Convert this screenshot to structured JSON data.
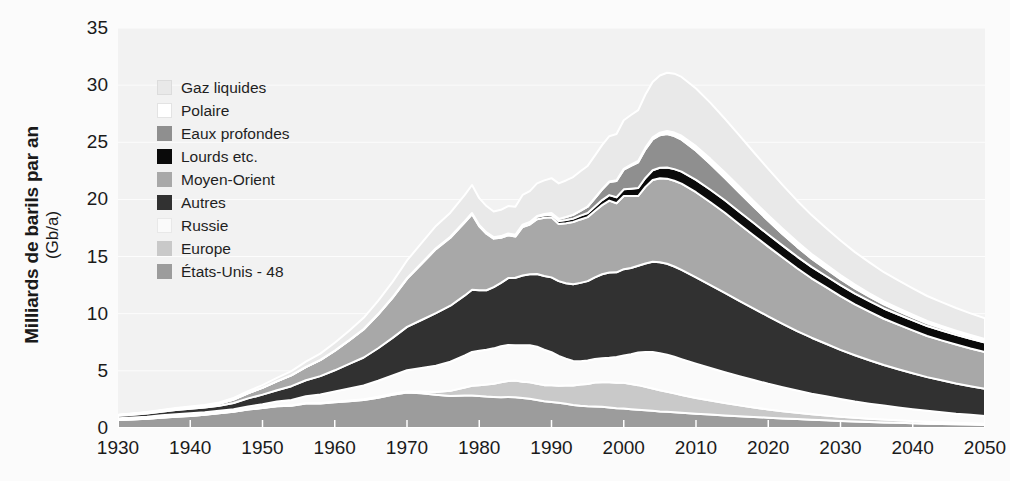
{
  "axes": {
    "y_title_line1": "Milliards de barils par an",
    "y_title_line2": "(Gb/a)",
    "y_ticks": [
      "35",
      "30",
      "25",
      "20",
      "15",
      "10",
      "5",
      "0"
    ],
    "x_ticks": [
      "1930",
      "1940",
      "1950",
      "1960",
      "1970",
      "1980",
      "1990",
      "2000",
      "2010",
      "2020",
      "2030",
      "2040",
      "2050"
    ]
  },
  "legend": {
    "items": [
      {
        "label": "Gaz liquides",
        "color": "#e9e9e9",
        "border": "#dcdcdc"
      },
      {
        "label": "Polaire",
        "color": "#ffffff",
        "border": "#e3e3e3"
      },
      {
        "label": "Eaux profondes",
        "color": "#8f8f8f",
        "border": "#8f8f8f"
      },
      {
        "label": "Lourds etc.",
        "color": "#0a0a0a",
        "border": "#0a0a0a"
      },
      {
        "label": "Moyen-Orient",
        "color": "#a8a8a8",
        "border": "#a8a8a8"
      },
      {
        "label": "Autres",
        "color": "#313131",
        "border": "#313131"
      },
      {
        "label": "Russie",
        "color": "#fafafa",
        "border": "#e8e8e8"
      },
      {
        "label": "Europe",
        "color": "#c9c9c9",
        "border": "#c9c9c9"
      },
      {
        "label": "États-Unis - 48",
        "color": "#9c9c9c",
        "border": "#9c9c9c"
      }
    ]
  },
  "chart_data": {
    "type": "area",
    "stacked": true,
    "title": "",
    "xlabel": "",
    "ylabel": "Milliards de barils par an (Gb/a)",
    "xlim": [
      1930,
      2050
    ],
    "ylim": [
      0,
      35
    ],
    "grid": true,
    "legend_position": "inside-top-left",
    "plot_background": "#f2f2f2",
    "separator_color": "#ffffff",
    "x": [
      1930,
      1932,
      1934,
      1936,
      1938,
      1940,
      1942,
      1944,
      1946,
      1948,
      1950,
      1952,
      1954,
      1956,
      1958,
      1960,
      1962,
      1964,
      1966,
      1968,
      1970,
      1972,
      1974,
      1976,
      1978,
      1979,
      1980,
      1981,
      1982,
      1983,
      1984,
      1985,
      1986,
      1987,
      1988,
      1989,
      1990,
      1991,
      1992,
      1993,
      1994,
      1995,
      1996,
      1997,
      1998,
      1999,
      2000,
      2001,
      2002,
      2003,
      2004,
      2005,
      2006,
      2007,
      2008,
      2010,
      2012,
      2014,
      2016,
      2018,
      2020,
      2022,
      2024,
      2026,
      2028,
      2030,
      2032,
      2034,
      2036,
      2038,
      2040,
      2042,
      2044,
      2046,
      2048,
      2050
    ],
    "series": [
      {
        "name": "États-Unis - 48",
        "color": "#9c9c9c",
        "values": [
          0.7,
          0.75,
          0.8,
          0.9,
          0.98,
          1.05,
          1.15,
          1.3,
          1.42,
          1.62,
          1.75,
          1.9,
          1.95,
          2.15,
          2.15,
          2.25,
          2.35,
          2.45,
          2.65,
          2.9,
          3.1,
          3.05,
          2.9,
          2.8,
          2.85,
          2.85,
          2.8,
          2.75,
          2.72,
          2.7,
          2.72,
          2.7,
          2.62,
          2.55,
          2.45,
          2.35,
          2.28,
          2.2,
          2.12,
          2.02,
          1.95,
          1.9,
          1.88,
          1.85,
          1.8,
          1.72,
          1.7,
          1.65,
          1.6,
          1.55,
          1.5,
          1.45,
          1.42,
          1.38,
          1.33,
          1.25,
          1.18,
          1.1,
          1.03,
          0.97,
          0.9,
          0.84,
          0.78,
          0.72,
          0.67,
          0.62,
          0.57,
          0.53,
          0.49,
          0.45,
          0.42,
          0.38,
          0.35,
          0.32,
          0.3,
          0.27
        ]
      },
      {
        "name": "Europe",
        "color": "#c9c9c9",
        "values": [
          0.02,
          0.02,
          0.02,
          0.02,
          0.02,
          0.02,
          0.02,
          0.02,
          0.02,
          0.02,
          0.02,
          0.03,
          0.03,
          0.03,
          0.04,
          0.05,
          0.06,
          0.07,
          0.08,
          0.09,
          0.1,
          0.15,
          0.25,
          0.45,
          0.7,
          0.85,
          0.95,
          1.05,
          1.15,
          1.3,
          1.4,
          1.45,
          1.42,
          1.45,
          1.42,
          1.4,
          1.45,
          1.5,
          1.6,
          1.7,
          1.85,
          1.95,
          2.1,
          2.15,
          2.2,
          2.25,
          2.25,
          2.2,
          2.15,
          2.05,
          1.95,
          1.85,
          1.75,
          1.65,
          1.55,
          1.38,
          1.22,
          1.08,
          0.95,
          0.83,
          0.72,
          0.63,
          0.55,
          0.48,
          0.42,
          0.37,
          0.32,
          0.28,
          0.25,
          0.22,
          0.19,
          0.17,
          0.15,
          0.13,
          0.12,
          0.1
        ]
      },
      {
        "name": "Russie",
        "color": "#fafafa",
        "values": [
          0.13,
          0.15,
          0.17,
          0.19,
          0.21,
          0.22,
          0.2,
          0.18,
          0.2,
          0.25,
          0.3,
          0.38,
          0.48,
          0.6,
          0.75,
          0.9,
          1.05,
          1.2,
          1.4,
          1.6,
          1.85,
          2.05,
          2.3,
          2.55,
          2.8,
          2.95,
          3.0,
          3.05,
          3.1,
          3.15,
          3.15,
          3.1,
          3.2,
          3.25,
          3.25,
          3.1,
          2.9,
          2.6,
          2.35,
          2.15,
          2.05,
          2.05,
          2.05,
          2.1,
          2.15,
          2.25,
          2.4,
          2.6,
          2.85,
          3.05,
          3.2,
          3.25,
          3.25,
          3.2,
          3.15,
          3.0,
          2.85,
          2.7,
          2.55,
          2.4,
          2.25,
          2.1,
          1.95,
          1.8,
          1.68,
          1.55,
          1.43,
          1.32,
          1.22,
          1.12,
          1.03,
          0.95,
          0.87,
          0.8,
          0.74,
          0.68
        ]
      },
      {
        "name": "Autres",
        "color": "#313131",
        "values": [
          0.22,
          0.25,
          0.28,
          0.32,
          0.36,
          0.4,
          0.42,
          0.45,
          0.55,
          0.7,
          0.85,
          1.0,
          1.2,
          1.4,
          1.6,
          1.85,
          2.15,
          2.45,
          2.85,
          3.3,
          3.8,
          4.2,
          4.6,
          4.9,
          5.25,
          5.45,
          5.3,
          5.2,
          5.35,
          5.55,
          5.85,
          5.9,
          6.1,
          6.2,
          6.35,
          6.45,
          6.55,
          6.55,
          6.6,
          6.7,
          6.85,
          6.95,
          7.15,
          7.35,
          7.45,
          7.4,
          7.55,
          7.55,
          7.6,
          7.75,
          7.9,
          7.95,
          7.95,
          7.9,
          7.8,
          7.55,
          7.25,
          6.95,
          6.6,
          6.25,
          5.9,
          5.55,
          5.2,
          4.9,
          4.6,
          4.3,
          4.05,
          3.8,
          3.55,
          3.35,
          3.15,
          2.95,
          2.8,
          2.65,
          2.5,
          2.38
        ]
      },
      {
        "name": "Moyen-Orient",
        "color": "#a8a8a8",
        "values": [
          0.05,
          0.06,
          0.07,
          0.09,
          0.11,
          0.12,
          0.14,
          0.18,
          0.3,
          0.45,
          0.6,
          0.78,
          0.95,
          1.15,
          1.4,
          1.7,
          2.05,
          2.45,
          2.95,
          3.5,
          4.2,
          4.9,
          5.6,
          5.95,
          6.4,
          6.6,
          5.6,
          4.95,
          4.25,
          3.95,
          3.75,
          3.6,
          4.25,
          4.35,
          4.8,
          5.1,
          5.25,
          5.0,
          5.25,
          5.45,
          5.55,
          5.6,
          5.8,
          6.05,
          6.3,
          6.05,
          6.4,
          6.3,
          6.1,
          6.7,
          7.15,
          7.35,
          7.45,
          7.5,
          7.55,
          7.45,
          7.25,
          7.0,
          6.7,
          6.4,
          6.1,
          5.8,
          5.5,
          5.2,
          4.95,
          4.7,
          4.45,
          4.25,
          4.05,
          3.9,
          3.75,
          3.6,
          3.5,
          3.4,
          3.3,
          3.22
        ]
      },
      {
        "name": "Lourds etc.",
        "color": "#0a0a0a",
        "values": [
          0.01,
          0.01,
          0.01,
          0.01,
          0.01,
          0.01,
          0.01,
          0.01,
          0.01,
          0.01,
          0.01,
          0.01,
          0.02,
          0.02,
          0.02,
          0.03,
          0.03,
          0.04,
          0.04,
          0.05,
          0.06,
          0.07,
          0.08,
          0.09,
          0.1,
          0.11,
          0.11,
          0.12,
          0.13,
          0.14,
          0.15,
          0.16,
          0.18,
          0.19,
          0.21,
          0.22,
          0.24,
          0.26,
          0.28,
          0.3,
          0.33,
          0.36,
          0.4,
          0.44,
          0.48,
          0.52,
          0.58,
          0.64,
          0.7,
          0.78,
          0.85,
          0.92,
          0.98,
          1.02,
          1.05,
          1.08,
          1.1,
          1.1,
          1.1,
          1.08,
          1.06,
          1.04,
          1.02,
          1.0,
          0.98,
          0.96,
          0.94,
          0.92,
          0.9,
          0.89,
          0.88,
          0.87,
          0.86,
          0.85,
          0.84,
          0.83
        ]
      },
      {
        "name": "Eaux profondes",
        "color": "#8f8f8f",
        "values": [
          0,
          0,
          0,
          0,
          0,
          0,
          0,
          0,
          0,
          0,
          0,
          0,
          0,
          0,
          0,
          0,
          0,
          0,
          0,
          0,
          0,
          0,
          0,
          0,
          0,
          0,
          0,
          0,
          0,
          0,
          0,
          0,
          0.02,
          0.04,
          0.07,
          0.1,
          0.14,
          0.19,
          0.25,
          0.33,
          0.42,
          0.55,
          0.72,
          0.92,
          1.15,
          1.42,
          1.72,
          2.0,
          2.25,
          2.5,
          2.7,
          2.85,
          2.92,
          2.9,
          2.8,
          2.55,
          2.25,
          1.95,
          1.68,
          1.42,
          1.2,
          1.0,
          0.85,
          0.72,
          0.62,
          0.53,
          0.46,
          0.4,
          0.35,
          0.31,
          0.27,
          0.24,
          0.21,
          0.19,
          0.17,
          0.15
        ]
      },
      {
        "name": "Polaire",
        "color": "#ffffff",
        "values": [
          0,
          0,
          0,
          0,
          0,
          0,
          0,
          0,
          0,
          0,
          0,
          0,
          0,
          0,
          0,
          0,
          0,
          0,
          0,
          0,
          0,
          0,
          0,
          0,
          0,
          0,
          0,
          0,
          0,
          0,
          0,
          0,
          0,
          0,
          0,
          0,
          0,
          0,
          0.01,
          0.01,
          0.02,
          0.02,
          0.03,
          0.04,
          0.05,
          0.06,
          0.08,
          0.1,
          0.12,
          0.15,
          0.18,
          0.22,
          0.26,
          0.3,
          0.34,
          0.4,
          0.45,
          0.48,
          0.5,
          0.5,
          0.49,
          0.47,
          0.44,
          0.41,
          0.38,
          0.35,
          0.32,
          0.29,
          0.27,
          0.25,
          0.23,
          0.21,
          0.19,
          0.18,
          0.17,
          0.16
        ]
      },
      {
        "name": "Gaz liquides",
        "color": "#e9e9e9",
        "values": [
          0.03,
          0.03,
          0.04,
          0.05,
          0.06,
          0.07,
          0.08,
          0.1,
          0.13,
          0.17,
          0.22,
          0.28,
          0.35,
          0.45,
          0.55,
          0.68,
          0.82,
          0.98,
          1.15,
          1.35,
          1.55,
          1.75,
          1.95,
          2.1,
          2.3,
          2.45,
          2.35,
          2.3,
          2.25,
          2.3,
          2.4,
          2.45,
          2.6,
          2.7,
          2.85,
          2.95,
          3.05,
          3.1,
          3.2,
          3.3,
          3.45,
          3.55,
          3.7,
          3.85,
          3.95,
          4.05,
          4.25,
          4.35,
          4.45,
          4.65,
          4.85,
          5.0,
          5.1,
          5.15,
          5.15,
          5.05,
          4.9,
          4.7,
          4.5,
          4.28,
          4.05,
          3.82,
          3.6,
          3.4,
          3.2,
          3.02,
          2.85,
          2.7,
          2.55,
          2.42,
          2.3,
          2.18,
          2.08,
          1.98,
          1.89,
          1.8
        ]
      }
    ],
    "notes": {
      "peak_year": 2007,
      "peak_total": 30.5,
      "start_total_1930": 1.16,
      "end_total_2050": 9.43
    }
  }
}
